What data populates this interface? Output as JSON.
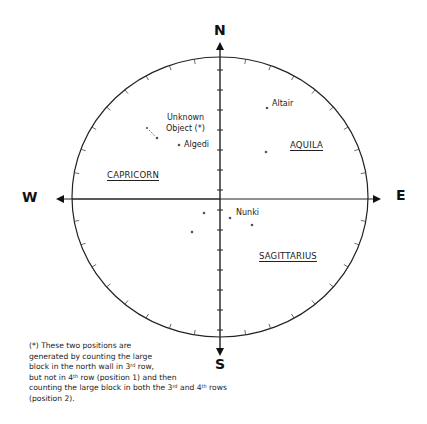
{
  "diagram": {
    "type": "sky-map",
    "cardinals": {
      "north": "N",
      "south": "S",
      "east": "E",
      "west": "W"
    },
    "constellations": [
      {
        "name": "CAPRICORN"
      },
      {
        "name": "AQUILA"
      },
      {
        "name": "SAGITTARIUS"
      }
    ],
    "stars": [
      {
        "name": "Altair"
      },
      {
        "name": "Algedi"
      },
      {
        "name": "Nunki"
      }
    ],
    "unknown_object": {
      "line1": "Unknown",
      "line2": "Object (*)"
    },
    "footnote": {
      "line1": "(*) These two positions are",
      "line2": "generated by counting the large",
      "line3_a": "block in the north wall in 3",
      "line3_sup": "rd",
      "line3_b": " row,",
      "line4_a": "but not in 4",
      "line4_sup": "th",
      "line4_b": " row (position 1) and then",
      "line5_a": "counting the large block in both the 3",
      "line5_sup": "rd",
      "line5_b": " and 4",
      "line5_sup2": "th",
      "line5_c": " rows",
      "line6": "(position 2)."
    }
  }
}
